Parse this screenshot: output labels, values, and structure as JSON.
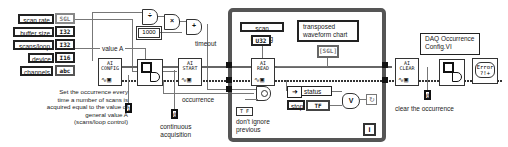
{
  "controls": [
    {
      "label": "scan rate",
      "type": "SGL"
    },
    {
      "label": "buffer size",
      "type": "I32"
    },
    {
      "label": "scans/loop",
      "type": "I32"
    },
    {
      "label": "device",
      "type": "I16"
    },
    {
      "label": "channels",
      "type": "abc"
    }
  ],
  "arith": {
    "divide": "÷",
    "multiply": "×",
    "add": "+",
    "constant": "1000",
    "output_label": "timeout"
  },
  "wire_labels": {
    "value_a": "value A",
    "occurrence": "occurrence"
  },
  "vis": {
    "config": {
      "title": "AI",
      "name": "CONFIG"
    },
    "start": {
      "title": "AI",
      "name": "START"
    },
    "read": {
      "title": "AI",
      "name": "READ"
    },
    "clear": {
      "title": "AI",
      "name": "CLEAR"
    },
    "error": {
      "name": "Error ?!+"
    }
  },
  "occurrence_config": {
    "left_const": "1",
    "right_const": "0"
  },
  "start_const": "0",
  "annotations": {
    "occurrence_note": [
      "Set the occurrence every",
      "time a number of scans is",
      "acquired equal to the value of",
      "general value A",
      "(scans/loop control)"
    ],
    "continuous": [
      "continuous",
      "acquisition"
    ],
    "dont_ignore": [
      "don't ignore",
      "previous"
    ],
    "clear_occurrence": "clear the occurrence",
    "daq_occ_vi": [
      "DAQ Occurrence",
      "Config.VI"
    ]
  },
  "loop": {
    "scan_backlog": {
      "label": "scan backlog",
      "type": "U32"
    },
    "chart": {
      "label": [
        "transposed",
        "waveform chart"
      ],
      "type": "[SGL]"
    },
    "status": {
      "label": "status"
    },
    "stop": {
      "label": "stop",
      "type": "TF"
    },
    "dont_ignore_const": "T F",
    "or_gate": "V",
    "iteration": "i"
  }
}
